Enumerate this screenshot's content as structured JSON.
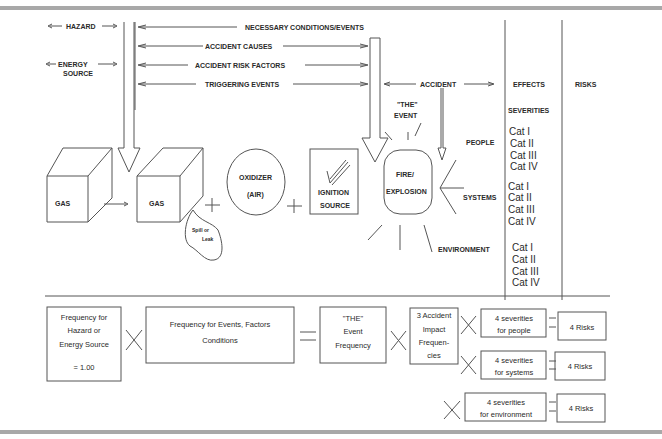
{
  "top_labels": {
    "hazard": "HAZARD",
    "energy_source_1": "ENERGY",
    "energy_source_2": "SOURCE",
    "necessary": "NECESSARY CONDITIONS/EVENTS",
    "causes": "ACCIDENT CAUSES",
    "risk_factors": "ACCIDENT RISK FACTORS",
    "triggering": "TRIGGERING EVENTS",
    "accident": "ACCIDENT",
    "effects": "EFFECTS",
    "risks": "RISKS",
    "severities": "SEVERITIES"
  },
  "components": {
    "gas1": "GAS",
    "gas2": "GAS",
    "spill_1": "Spill  or",
    "spill_2": "Leak",
    "oxidizer_1": "OXIDIZER",
    "oxidizer_2": "(AIR)",
    "ignition_1": "IGNITION",
    "ignition_2": "SOURCE",
    "the_event_1": "\"THE\"",
    "the_event_2": "EVENT",
    "fire_1": "FIRE/",
    "fire_2": "EXPLOSION"
  },
  "targets": {
    "people": "PEOPLE",
    "systems": "SYSTEMS",
    "environment": "ENVIRONMENT"
  },
  "severity_groups": [
    [
      "Cat I",
      "Cat II",
      "Cat III",
      "Cat IV"
    ],
    [
      "Cat I",
      "Cat II",
      "Cat III",
      "Cat IV"
    ],
    [
      "Cat I",
      "Cat II",
      "Cat III",
      "Cat IV"
    ]
  ],
  "equation": {
    "hazard_freq": [
      "Frequency for",
      "Hazard or",
      "Energy Source",
      "= 1.00"
    ],
    "events_freq": [
      "Frequency for Events, Factors",
      "Conditions"
    ],
    "the_event_freq": [
      "\"THE\"",
      "Event",
      "Frequency"
    ],
    "impact_freq": [
      "3 Accident",
      "Impact",
      "Frequen-",
      "cies"
    ],
    "sev_people": [
      "4 severities",
      "for people"
    ],
    "sev_systems": [
      "4 severities",
      "for systems"
    ],
    "sev_env": [
      "4 severities",
      "for environment"
    ],
    "risks": "4 Risks"
  }
}
